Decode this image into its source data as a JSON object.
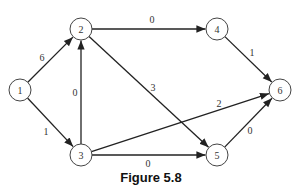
{
  "figure": {
    "caption": "Figure 5.8"
  },
  "graph": {
    "directed": true,
    "nodes": [
      {
        "id": "1",
        "label": "1",
        "x": 20,
        "y": 90
      },
      {
        "id": "2",
        "label": "2",
        "x": 81,
        "y": 29
      },
      {
        "id": "3",
        "label": "3",
        "x": 81,
        "y": 155
      },
      {
        "id": "4",
        "label": "4",
        "x": 217,
        "y": 29
      },
      {
        "id": "5",
        "label": "5",
        "x": 217,
        "y": 155
      },
      {
        "id": "6",
        "label": "6",
        "x": 280,
        "y": 90
      }
    ],
    "edges": [
      {
        "from": "1",
        "to": "2",
        "weight": "6",
        "lx": 42,
        "ly": 57
      },
      {
        "from": "1",
        "to": "3",
        "weight": "1",
        "lx": 46,
        "ly": 131
      },
      {
        "from": "3",
        "to": "2",
        "weight": "0",
        "lx": 75,
        "ly": 92
      },
      {
        "from": "2",
        "to": "4",
        "weight": "0",
        "lx": 152,
        "ly": 19
      },
      {
        "from": "2",
        "to": "5",
        "weight": "3",
        "lx": 153,
        "ly": 87
      },
      {
        "from": "3",
        "to": "6",
        "weight": "2",
        "lx": 219,
        "ly": 103
      },
      {
        "from": "3",
        "to": "5",
        "weight": "0",
        "lx": 148,
        "ly": 163
      },
      {
        "from": "4",
        "to": "6",
        "weight": "1",
        "lx": 252,
        "ly": 52
      },
      {
        "from": "5",
        "to": "6",
        "weight": "0",
        "lx": 250,
        "ly": 130
      }
    ]
  }
}
